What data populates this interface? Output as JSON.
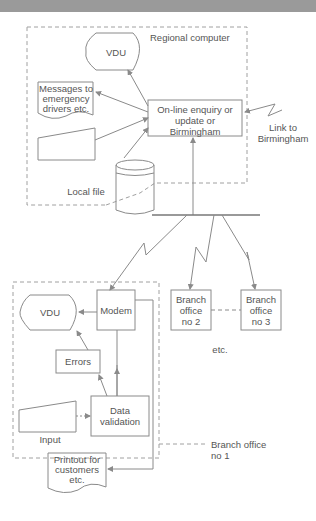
{
  "header": {
    "band_color": "#9a9a9a"
  },
  "colors": {
    "line": "#8a8a8a",
    "text": "#555555",
    "dashed": "#a0a0a0"
  },
  "regional": {
    "title": "Regional computer",
    "vdu": "VDU",
    "messages": "Messages to emergency drivers etc.",
    "messages_lines": [
      "Messages to",
      "emergency",
      "drivers etc."
    ],
    "central_box_lines": [
      "On-line enquiry or",
      "update or",
      "Birmingham"
    ],
    "local_file": "Local file",
    "link_lines": [
      "Link to",
      "Birmingham"
    ]
  },
  "branches": {
    "office2_lines": [
      "Branch",
      "office",
      "no 2"
    ],
    "office3_lines": [
      "Branch",
      "office",
      "no 3"
    ],
    "etc": "etc."
  },
  "branch1": {
    "vdu": "VDU",
    "modem": "Modem",
    "errors": "Errors",
    "input": "Input",
    "validation_lines": [
      "Data",
      "validation"
    ],
    "printout_lines": [
      "Printout for",
      "customers",
      "etc."
    ],
    "label_lines": [
      "Branch office",
      "no 1"
    ]
  }
}
